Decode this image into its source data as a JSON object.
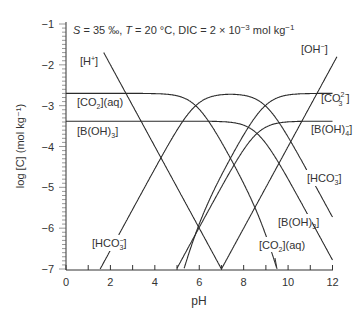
{
  "chart_data": {
    "type": "line",
    "title_parts": {
      "S": "S",
      "s_val": " = 35 ‰, ",
      "T": "T",
      "t_val": " = 20 °C, DIC = 2 × 10",
      "exp": "−3",
      "unit": " mol kg",
      "unit_exp": "−1"
    },
    "xlabel": "pH",
    "ylabel": "log [C] (mol kg⁻¹)",
    "xlim": [
      0,
      12
    ],
    "ylim": [
      -7,
      -1
    ],
    "x_ticks": [
      0,
      2,
      4,
      6,
      8,
      10,
      12
    ],
    "y_ticks": [
      -1,
      -2,
      -3,
      -4,
      -5,
      -6,
      -7
    ],
    "y_tick_labels": [
      "−1",
      "−2",
      "−3",
      "−4",
      "−5",
      "−6",
      "−7"
    ],
    "grid": false,
    "parameters": {
      "log_DIC": -2.699,
      "log_BT": -3.38,
      "pK1": 5.84,
      "pK2": 8.97,
      "pKB": 8.6,
      "pKw": 14.0
    },
    "series": [
      {
        "name": "[H⁺]",
        "key": "H"
      },
      {
        "name": "[OH⁻]",
        "key": "OH"
      },
      {
        "name": "[CO₂](aq)",
        "key": "CO2"
      },
      {
        "name": "[HCO₃⁻]",
        "key": "HCO3"
      },
      {
        "name": "[CO₃²⁻]",
        "key": "CO3"
      },
      {
        "name": "[B(OH)₃]",
        "key": "BOH3"
      },
      {
        "name": "[B(OH)₄⁻]",
        "key": "BOH4"
      }
    ],
    "sample_points": {
      "x": [
        0,
        2,
        4,
        6,
        8,
        10,
        12
      ],
      "H": [
        null,
        -2,
        -4,
        -6,
        null,
        null,
        null
      ],
      "OH": [
        null,
        null,
        null,
        null,
        -6,
        -4,
        -2
      ],
      "CO2": [
        -2.7,
        -2.7,
        -2.71,
        -3.03,
        -4.88,
        -7.87,
        null
      ],
      "HCO3": [
        null,
        -6.54,
        -4.55,
        -2.87,
        -2.74,
        -3.74,
        -5.67
      ],
      "CO3": [
        null,
        null,
        null,
        -5.84,
        -3.71,
        -2.74,
        -2.7
      ],
      "BOH3": [
        -3.38,
        -3.38,
        -3.38,
        -3.38,
        -3.47,
        -4.8,
        -6.78
      ],
      "BOH4": [
        null,
        null,
        -7.98,
        -5.98,
        -4.16,
        -3.4,
        -3.38
      ]
    },
    "labels": {
      "H": "[H",
      "H_sup": "+",
      "H_end": "]",
      "OH": "[OH",
      "OH_sup": "−",
      "OH_end": "]",
      "CO2_left": "[CO",
      "CO2_sub": "2",
      "CO2_end": "](aq)",
      "BOH3_left": "[B(OH)",
      "BOH3_sub": "3",
      "BOH3_end": "]",
      "CO3": "[CO",
      "CO3_sup": "2−",
      "CO3_sub": "3",
      "CO3_end": "]",
      "BOH4": "[B(OH)",
      "BOH4_sup": "−",
      "BOH4_sub": "4",
      "BOH4_end": "]",
      "HCO3": "[HCO",
      "HCO3_sup": "−",
      "HCO3_sub": "3",
      "HCO3_end": "]"
    }
  }
}
